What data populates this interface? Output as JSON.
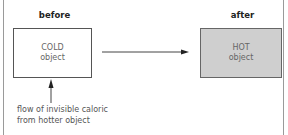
{
  "diagram": {
    "before_label": "before",
    "after_label": "after",
    "cold_box": {
      "line1": "COLD",
      "line2": "object",
      "fill": "#ffffff"
    },
    "hot_box": {
      "line1": "HOT",
      "line2": "object",
      "fill": "#cfcfcf"
    },
    "caption": {
      "line1": "flow of invisible caloric",
      "line2": "from hotter object"
    },
    "arrows": [
      {
        "name": "transition-arrow",
        "from": "cold_box",
        "to": "hot_box",
        "direction": "right"
      },
      {
        "name": "caloric-flow-arrow",
        "from": "caption",
        "to": "cold_box",
        "direction": "up"
      }
    ]
  }
}
